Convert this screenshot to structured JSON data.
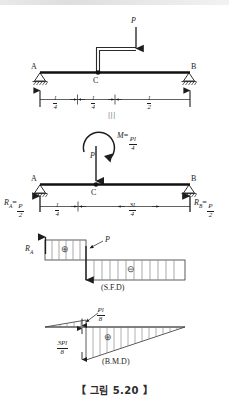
{
  "figure": {
    "caption": "【 그림  5.20 】",
    "separator_mark": "|||"
  },
  "panel1": {
    "name": "loaded-beam-with-bracket",
    "support_left_label": "A",
    "support_right_label": "B",
    "point_c_label": "C",
    "load_label": "P",
    "dimensions": [
      {
        "num": "l",
        "den": "4",
        "text": "l/4"
      },
      {
        "num": "l",
        "den": "4",
        "text": "l/4"
      },
      {
        "num": "l",
        "den": "2",
        "text": "l/2"
      }
    ]
  },
  "panel2": {
    "name": "equivalent-load-system",
    "support_left_label": "A",
    "support_right_label": "B",
    "point_c_label": "C",
    "load_label": "P",
    "moment": {
      "symbol": "M",
      "equals": "=",
      "num": "Pl",
      "den": "4",
      "text": "M = Pl/4"
    },
    "reaction_left": {
      "symbol": "R",
      "sub": "A",
      "equals": "=",
      "num": "P",
      "den": "2",
      "text": "R_A = P/2"
    },
    "reaction_right": {
      "symbol": "R",
      "sub": "B",
      "equals": "=",
      "num": "P",
      "den": "2",
      "text": "R_B = P/2"
    },
    "dimensions": [
      {
        "num": "l",
        "den": "4",
        "text": "l/4"
      },
      {
        "num": "3l",
        "den": "4",
        "text": "3l/4"
      }
    ]
  },
  "panel3": {
    "name": "shear-force-diagram",
    "title": "(S.F.D)",
    "left_value_label": {
      "symbol": "R",
      "sub": "A",
      "text": "R_A"
    },
    "right_value_label": "P",
    "positive_sign": "⊕",
    "negative_sign": "⊖"
  },
  "panel4": {
    "name": "bending-moment-diagram",
    "title": "(B.M.D)",
    "peak_positive": {
      "num": "Pl",
      "den": "8",
      "text": "Pl/8"
    },
    "peak_negative": {
      "num": "3Pl",
      "den": "8",
      "text": "3Pl/8"
    },
    "positive_sign": "⊕"
  },
  "colors": {
    "ink": "#1d1d1d",
    "beam": "#111111",
    "hatch": "#6e6e6e",
    "caption": "#2b2b2b"
  }
}
